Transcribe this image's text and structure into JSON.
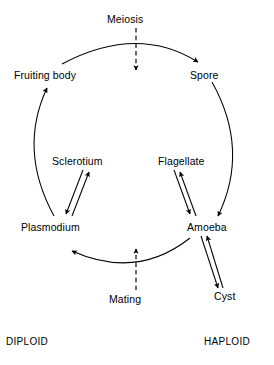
{
  "diagram": {
    "background_color": "#ffffff",
    "stroke_color": "#000000",
    "nodes": {
      "meiosis": "Meiosis",
      "fruiting_body": "Fruiting body",
      "spore": "Spore",
      "sclerotium": "Sclerotium",
      "flagellate": "Flagellate",
      "plasmodium": "Plasmodium",
      "amoeba": "Amoeba",
      "cyst": "Cyst",
      "mating": "Mating"
    },
    "ploidy": {
      "left": "DIPLOID",
      "right": "HAPLOID"
    },
    "edges": [
      {
        "from": "Fruiting body",
        "to": "Spore",
        "style": "solid-arc",
        "arrow": "single"
      },
      {
        "from": "Meiosis",
        "to": "Spore",
        "style": "dashed-straight",
        "arrow": "down"
      },
      {
        "from": "Spore",
        "to": "Amoeba",
        "style": "solid-arc",
        "arrow": "single"
      },
      {
        "from": "Flagellate",
        "to": "Amoeba",
        "style": "solid-straight",
        "arrow": "double"
      },
      {
        "from": "Amoeba",
        "to": "Cyst",
        "style": "solid-straight",
        "arrow": "double"
      },
      {
        "from": "Amoeba",
        "to": "Plasmodium",
        "style": "solid-arc",
        "arrow": "single"
      },
      {
        "from": "Mating",
        "to": "Plasmodium",
        "style": "dashed-straight",
        "arrow": "up"
      },
      {
        "from": "Plasmodium",
        "to": "Sclerotium",
        "style": "solid-straight",
        "arrow": "double"
      },
      {
        "from": "Plasmodium",
        "to": "Fruiting body",
        "style": "solid-arc",
        "arrow": "single"
      }
    ]
  }
}
